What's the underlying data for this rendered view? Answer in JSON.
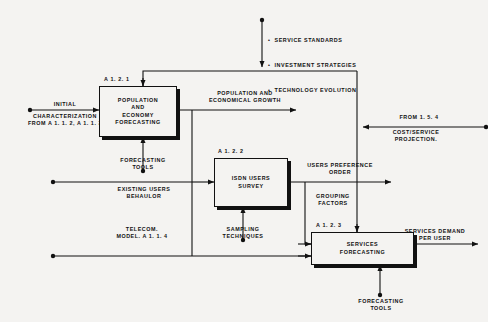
{
  "diagram": {
    "line_color": "#111111",
    "background": "#f4f3f1"
  },
  "boxes": [
    {
      "id": "a121",
      "tag": "A 1. 2. 1",
      "text": "POPULATION\nAND\nECONOMY\nFORECASTING"
    },
    {
      "id": "a122",
      "tag": "A 1. 2. 2",
      "text": "ISDN USERS\nSURVEY"
    },
    {
      "id": "a123",
      "tag": "A 1. 2. 3",
      "text": "SERVICES\nFORECASTING"
    }
  ],
  "control_list": {
    "items": [
      "SERVICE STANDARDS",
      "INVESTMENT STRATEGIES",
      "TECHNOLOGY EVOLUTION"
    ]
  },
  "flows": {
    "initial": "INITIAL",
    "characterization": "CHARACTERIZATION\nFROM A 1. 1. 2, A 1. 1. 3",
    "population_growth": "POPULATION AND\nECONOMICAL GROWTH",
    "forecasting_tools_1": "FORECASTING\nTOOLS",
    "existing_users": "EXISTING USERS\nBEHAULOR",
    "telecom_model": "TELECOM.\nMODEL. A 1. 1. 4",
    "sampling_techniques": "SAMPLING\nTECHNIQUES",
    "users_preference": "USERS PREFERENCE\nORDER",
    "grouping_factors": "GROUPING\nFACTORS",
    "from_154": "FROM 1. 5. 4",
    "cost_service": "COST/SERVICE\nPROJECTION.",
    "forecasting_tools_2": "FORECASTING\nTOOLS",
    "services_demand": "SERVICES DEMAND\nPER USER"
  }
}
